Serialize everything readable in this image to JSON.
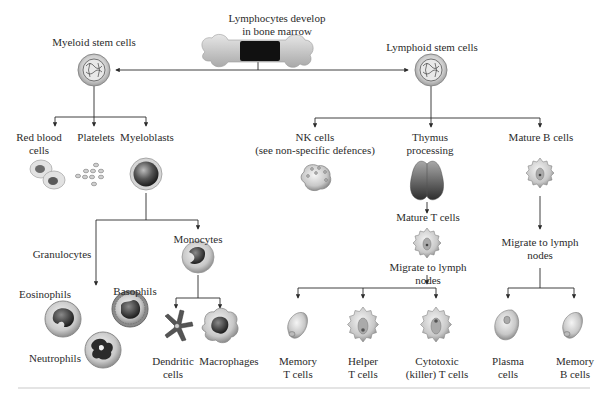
{
  "diagram": {
    "title": "Lymphocytes develop in bone marrow",
    "title_lines": [
      "Lymphocytes develop",
      "in bone marrow"
    ],
    "accent_colors": {
      "line": "#2a2a2a",
      "cell_gray": "#9a9a9a",
      "nucleus_dark": "#3a3a3a",
      "bone": "#cfcfcf",
      "marrow": "#111111"
    },
    "nodes": {
      "myeloid": {
        "label": "Myeloid stem cells"
      },
      "lymphoid": {
        "label": "Lymphoid stem cells"
      },
      "red_blood": {
        "lines": [
          "Red blood",
          "cells"
        ]
      },
      "platelets": {
        "label": "Platelets"
      },
      "myeloblasts": {
        "label": "Myeloblasts"
      },
      "granulocytes": {
        "label": "Granulocytes"
      },
      "monocytes": {
        "label": "Monocytes"
      },
      "eosinophils": {
        "label": "Eosinophils"
      },
      "basophils": {
        "label": "Basophils"
      },
      "neutrophils": {
        "label": "Neutrophils"
      },
      "dendritic": {
        "lines": [
          "Dendritic",
          "cells"
        ]
      },
      "macrophages": {
        "label": "Macrophages"
      },
      "nk": {
        "lines": [
          "NK cells",
          "(see non-specific defences)"
        ]
      },
      "thymus": {
        "lines": [
          "Thymus",
          "processing"
        ]
      },
      "mature_b": {
        "label": "Mature B cells"
      },
      "mature_t": {
        "label": "Mature T cells"
      },
      "migrate_t": {
        "lines": [
          "Migrate to lymph",
          "nodes"
        ]
      },
      "migrate_b": {
        "lines": [
          "Migrate to lymph",
          "nodes"
        ]
      },
      "memory_t": {
        "lines": [
          "Memory",
          "T cells"
        ]
      },
      "helper_t": {
        "lines": [
          "Helper",
          "T cells"
        ]
      },
      "cytotoxic_t": {
        "lines": [
          "Cytotoxic",
          "(killer) T cells"
        ]
      },
      "plasma": {
        "lines": [
          "Plasma",
          "cells"
        ]
      },
      "memory_b": {
        "lines": [
          "Memory",
          "B cells"
        ]
      }
    }
  }
}
